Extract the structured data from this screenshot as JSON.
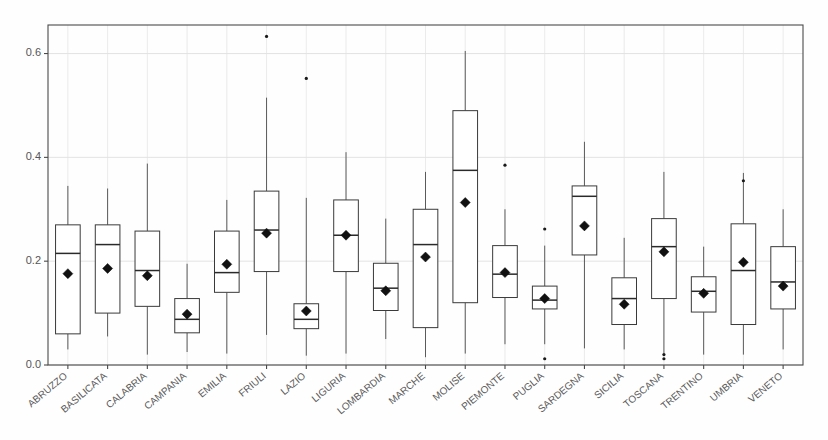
{
  "chart_data": {
    "type": "box",
    "title": "",
    "xlabel": "",
    "ylabel": "",
    "ylim": [
      0.0,
      0.655
    ],
    "yticks": [
      0.0,
      0.2,
      0.4,
      0.6
    ],
    "ytick_labels": [
      "0.0",
      "0.2",
      "0.4",
      "0.6"
    ],
    "grid": true,
    "legend": "none",
    "marker_note": "filled diamond = mean",
    "categories": [
      "ABRUZZO",
      "BASILICATA",
      "CALABRIA",
      "CAMPANIA",
      "EMILIA",
      "FRIULI",
      "LAZIO",
      "LIGURIA",
      "LOMBARDIA",
      "MARCHE",
      "MOLISE",
      "PIEMONTE",
      "PUGLIA",
      "SARDEGNA",
      "SICILIA",
      "TOSCANA",
      "TRENTINO",
      "UMBRIA",
      "VENETO"
    ],
    "boxes": [
      {
        "label": "ABRUZZO",
        "whisker_low": 0.03,
        "q1": 0.06,
        "median": 0.215,
        "q3": 0.27,
        "whisker_high": 0.345,
        "mean": 0.176,
        "outliers": []
      },
      {
        "label": "BASILICATA",
        "whisker_low": 0.055,
        "q1": 0.1,
        "median": 0.232,
        "q3": 0.27,
        "whisker_high": 0.34,
        "mean": 0.186,
        "outliers": []
      },
      {
        "label": "CALABRIA",
        "whisker_low": 0.02,
        "q1": 0.113,
        "median": 0.182,
        "q3": 0.258,
        "whisker_high": 0.388,
        "mean": 0.172,
        "outliers": []
      },
      {
        "label": "CAMPANIA",
        "whisker_low": 0.025,
        "q1": 0.062,
        "median": 0.088,
        "q3": 0.128,
        "whisker_high": 0.195,
        "mean": 0.098,
        "outliers": []
      },
      {
        "label": "EMILIA",
        "whisker_low": 0.022,
        "q1": 0.14,
        "median": 0.178,
        "q3": 0.258,
        "whisker_high": 0.318,
        "mean": 0.194,
        "outliers": []
      },
      {
        "label": "FRIULI",
        "whisker_low": 0.058,
        "q1": 0.18,
        "median": 0.26,
        "q3": 0.335,
        "whisker_high": 0.515,
        "mean": 0.254,
        "outliers": [
          0.633
        ]
      },
      {
        "label": "LAZIO",
        "whisker_low": 0.018,
        "q1": 0.07,
        "median": 0.088,
        "q3": 0.118,
        "whisker_high": 0.322,
        "mean": 0.104,
        "outliers": [
          0.552
        ]
      },
      {
        "label": "LIGURIA",
        "whisker_low": 0.022,
        "q1": 0.18,
        "median": 0.25,
        "q3": 0.318,
        "whisker_high": 0.41,
        "mean": 0.25,
        "outliers": []
      },
      {
        "label": "LOMBARDIA",
        "whisker_low": 0.05,
        "q1": 0.105,
        "median": 0.148,
        "q3": 0.196,
        "whisker_high": 0.282,
        "mean": 0.143,
        "outliers": []
      },
      {
        "label": "MARCHE",
        "whisker_low": 0.015,
        "q1": 0.072,
        "median": 0.232,
        "q3": 0.3,
        "whisker_high": 0.372,
        "mean": 0.208,
        "outliers": []
      },
      {
        "label": "MOLISE",
        "whisker_low": 0.022,
        "q1": 0.12,
        "median": 0.375,
        "q3": 0.49,
        "whisker_high": 0.605,
        "mean": 0.313,
        "outliers": []
      },
      {
        "label": "PIEMONTE",
        "whisker_low": 0.04,
        "q1": 0.13,
        "median": 0.175,
        "q3": 0.23,
        "whisker_high": 0.3,
        "mean": 0.178,
        "outliers": [
          0.385
        ]
      },
      {
        "label": "PUGLIA",
        "whisker_low": 0.04,
        "q1": 0.108,
        "median": 0.125,
        "q3": 0.152,
        "whisker_high": 0.23,
        "mean": 0.128,
        "outliers": [
          0.012,
          0.262
        ]
      },
      {
        "label": "SARDEGNA",
        "whisker_low": 0.032,
        "q1": 0.212,
        "median": 0.325,
        "q3": 0.345,
        "whisker_high": 0.43,
        "mean": 0.268,
        "outliers": []
      },
      {
        "label": "SICILIA",
        "whisker_low": 0.03,
        "q1": 0.078,
        "median": 0.128,
        "q3": 0.168,
        "whisker_high": 0.245,
        "mean": 0.117,
        "outliers": []
      },
      {
        "label": "TOSCANA",
        "whisker_low": 0.022,
        "q1": 0.128,
        "median": 0.228,
        "q3": 0.282,
        "whisker_high": 0.372,
        "mean": 0.218,
        "outliers": [
          0.012,
          0.02
        ]
      },
      {
        "label": "TRENTINO",
        "whisker_low": 0.02,
        "q1": 0.102,
        "median": 0.142,
        "q3": 0.17,
        "whisker_high": 0.228,
        "mean": 0.138,
        "outliers": []
      },
      {
        "label": "UMBRIA",
        "whisker_low": 0.02,
        "q1": 0.078,
        "median": 0.182,
        "q3": 0.272,
        "whisker_high": 0.37,
        "mean": 0.198,
        "outliers": [
          0.355
        ]
      },
      {
        "label": "VENETO",
        "whisker_low": 0.03,
        "q1": 0.108,
        "median": 0.16,
        "q3": 0.228,
        "whisker_high": 0.3,
        "mean": 0.152,
        "outliers": []
      }
    ]
  },
  "geometry": {
    "plot_left": 48,
    "plot_right": 803,
    "plot_top": 25,
    "plot_bottom": 365,
    "y_value_at_bottom": 0.0,
    "y_value_at_top": 0.655
  }
}
